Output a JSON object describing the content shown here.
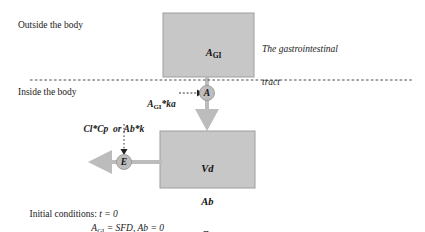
{
  "diagram": {
    "title_regions": {
      "outside_label": "Outside the body",
      "inside_label": "Inside the body"
    },
    "gi_box": {
      "name": "A",
      "subscript": "GI",
      "caption_line1": "The gastrointestinal",
      "caption_line2": "tract",
      "fill": "#c7c7c7"
    },
    "body_box": {
      "line1": "Vd",
      "line2": "Ab",
      "line3": "Cp",
      "fill": "#c7c7c7"
    },
    "absorption": {
      "rate_expr_base": "A",
      "rate_expr_sub": "GI",
      "rate_expr_tail": "*ka",
      "node_letter": "A"
    },
    "elimination": {
      "rate_expr_1": "Cl*Cp",
      "rate_expr_or": "or",
      "rate_expr_2": "Ab*k",
      "node_letter": "E"
    },
    "initial_conditions": {
      "line1_prefix": "Initial conditions: ",
      "line1_expr": "t = 0",
      "line2_base": "A",
      "line2_sub": "GI",
      "line2_tail": " = SFD, Ab = 0"
    },
    "colors": {
      "box_fill": "#c7c7c7",
      "box_stroke": "#9a9a9a",
      "arrow_gray": "#b9b9b9",
      "node_fill": "#bdbdbd",
      "dashed_line": "#555555",
      "text": "#1a1a1a"
    }
  }
}
